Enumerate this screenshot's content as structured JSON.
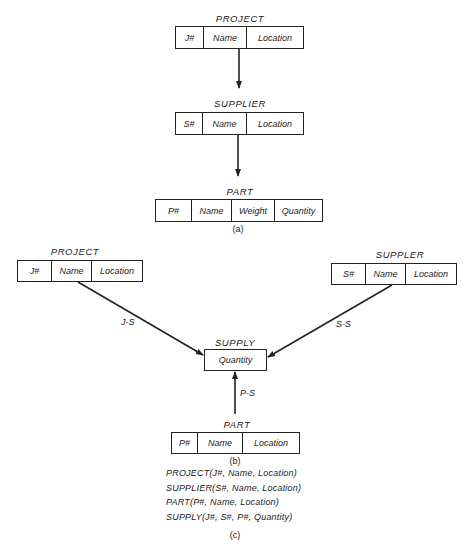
{
  "figure_a": {
    "project": {
      "title": "PROJECT",
      "fields": [
        "J#",
        "Name",
        "Location"
      ]
    },
    "supplier": {
      "title": "SUPPLIER",
      "fields": [
        "S#",
        "Name",
        "Location"
      ]
    },
    "part": {
      "title": "PART",
      "fields": [
        "P#",
        "Name",
        "Weight",
        "Quantity"
      ]
    },
    "caption": "(a)"
  },
  "figure_b": {
    "project": {
      "title": "PROJECT",
      "fields": [
        "J#",
        "Name",
        "Location"
      ]
    },
    "supplier": {
      "title": "SUPPLER",
      "fields": [
        "S#",
        "Name",
        "Location"
      ]
    },
    "supply": {
      "title": "SUPPLY",
      "fields": [
        "Quantity"
      ]
    },
    "part": {
      "title": "PART",
      "fields": [
        "P#",
        "Name",
        "Location"
      ]
    },
    "edges": {
      "js": "J-S",
      "ss": "S-S",
      "ps": "P-S"
    },
    "caption": "(b)"
  },
  "figure_c": {
    "schemas": [
      "PROJECT(J#, Name, Location)",
      "SUPPLIER(S#, Name, Location)",
      "PART(P#, Name, Location)",
      "SUPPLY(J#, S#, P#, Quantity)"
    ],
    "caption": "(c)"
  },
  "colors": {
    "line": "#222222",
    "text": "#1a1a1a",
    "background": "#ffffff"
  }
}
